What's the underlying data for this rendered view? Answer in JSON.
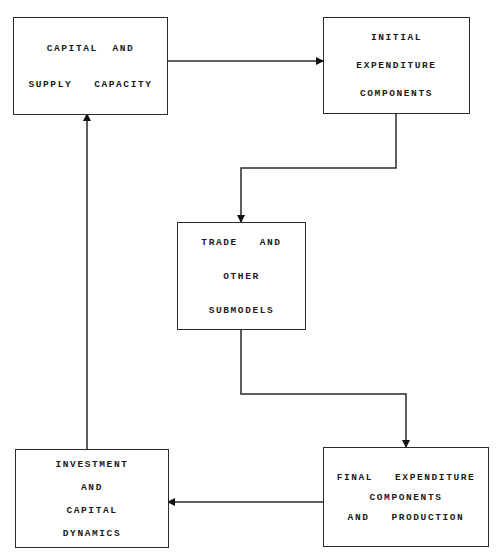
{
  "diagram": {
    "type": "flowchart-cycle",
    "nodes": [
      {
        "id": "capital_supply",
        "lines": [
          "CAPITAL  AND",
          "SUPPLY   CAPACITY"
        ]
      },
      {
        "id": "initial_expenditure",
        "lines": [
          "INITIAL",
          "EXPENDITURE",
          "COMPONENTS"
        ]
      },
      {
        "id": "trade_submodels",
        "lines": [
          "TRADE   AND",
          "OTHER",
          "SUBMODELS"
        ]
      },
      {
        "id": "final_expenditure",
        "lines": [
          "FINAL   EXPENDITURE",
          "COMPONENTS",
          "AND   PRODUCTION"
        ]
      },
      {
        "id": "investment_dynamics",
        "lines": [
          "INVESTMENT",
          "AND",
          "CAPITAL",
          "DYNAMICS"
        ]
      }
    ],
    "edges": [
      {
        "from": "capital_supply",
        "to": "initial_expenditure"
      },
      {
        "from": "initial_expenditure",
        "to": "trade_submodels"
      },
      {
        "from": "trade_submodels",
        "to": "final_expenditure"
      },
      {
        "from": "final_expenditure",
        "to": "investment_dynamics"
      },
      {
        "from": "investment_dynamics",
        "to": "capital_supply"
      }
    ],
    "colors": {
      "stroke": "#2a2a2a",
      "background": "#ffffff",
      "text": "#1a1a1a"
    }
  }
}
